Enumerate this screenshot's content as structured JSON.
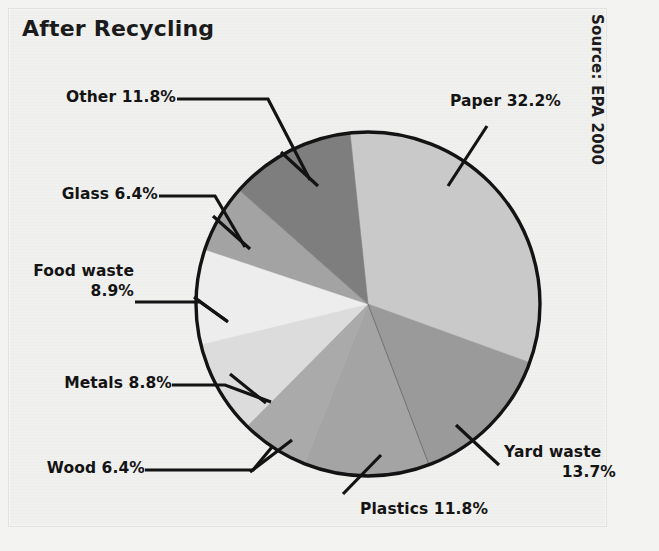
{
  "chart": {
    "title": "After Recycling",
    "source_note": "Source: EPA 2000"
  },
  "chart_data": {
    "type": "pie",
    "title": "After Recycling",
    "subtitle": "",
    "xlabel": "",
    "ylabel": "",
    "legend_position": "none",
    "grid": false,
    "annotations": [
      "Source: EPA 2000"
    ],
    "units": "percent",
    "start_angle_deg": -6,
    "direction": "clockwise",
    "categories": [
      "Paper",
      "Yard waste",
      "Plastics",
      "Wood",
      "Metals",
      "Food waste",
      "Glass",
      "Other"
    ],
    "values": [
      32.2,
      13.7,
      11.8,
      6.4,
      8.8,
      8.9,
      6.4,
      11.8
    ],
    "slices": [
      {
        "name": "Paper",
        "value": 32.2,
        "label": "Paper 32.2%",
        "color": "#c9c9c9"
      },
      {
        "name": "Yard waste",
        "value": 13.7,
        "label": "Yard waste\n13.7%",
        "color": "#9a9a9a"
      },
      {
        "name": "Plastics",
        "value": 11.8,
        "label": "Plastics 11.8%",
        "color": "#a4a4a4"
      },
      {
        "name": "Wood",
        "value": 6.4,
        "label": "Wood 6.4%",
        "color": "#aaaaaa"
      },
      {
        "name": "Metals",
        "value": 8.8,
        "label": "Metals 8.8%",
        "color": "#dcdcdc"
      },
      {
        "name": "Food waste",
        "value": 8.9,
        "label": "Food waste\n8.9%",
        "color": "#ededed"
      },
      {
        "name": "Glass",
        "value": 6.4,
        "label": "Glass 6.4%",
        "color": "#a3a3a3"
      },
      {
        "name": "Other",
        "value": 11.8,
        "label": "Other 11.8%",
        "color": "#7e7e7e"
      }
    ]
  },
  "labels": {
    "paper": "Paper 32.2%",
    "yard_waste_line1": "Yard waste",
    "yard_waste_line2": "13.7%",
    "plastics": "Plastics 11.8%",
    "wood": "Wood 6.4%",
    "metals": "Metals 8.8%",
    "food_waste_line1": "Food waste",
    "food_waste_line2": "8.9%",
    "glass": "Glass 6.4%",
    "other": "Other 11.8%"
  },
  "colors": {
    "paper": "#c9c9c9",
    "yard_waste": "#9a9a9a",
    "plastics": "#a4a4a4",
    "wood": "#aaaaaa",
    "metals": "#dcdcdc",
    "food_waste": "#ededed",
    "glass": "#a3a3a3",
    "other": "#7e7e7e",
    "outline": "#131313",
    "background": "#f0f0ef"
  }
}
